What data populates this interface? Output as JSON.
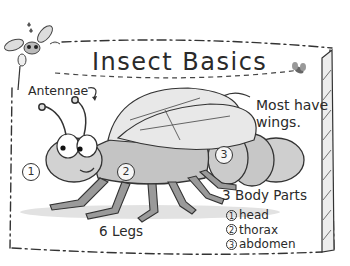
{
  "title": "Insect Basics",
  "labels": {
    "antennae": "Antennae",
    "wings_line1": "Most have",
    "wings_line2": "wings.",
    "legs": "6 Legs",
    "body_parts_title": "3 Body Parts"
  },
  "numbers": {
    "head_marker": "1",
    "thorax_marker": "2",
    "abdomen_marker": "3"
  },
  "body_parts": [
    {
      "num": "1",
      "name": "head"
    },
    {
      "num": "2",
      "name": "thorax"
    },
    {
      "num": "3",
      "name": "abdomen"
    }
  ],
  "icons": {
    "mascot": "cartoon-bug-mascot-icon",
    "small_fly": "small-fly-icon"
  },
  "colors": {
    "background": "#ffffff",
    "ink": "#2a2a2a",
    "body_fill": "#c9c9c9",
    "wing_fill": "#e6e6e6",
    "shadow": "#d8d8d8"
  }
}
